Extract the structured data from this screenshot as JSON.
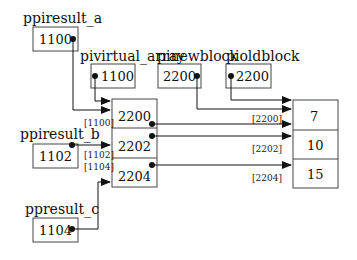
{
  "pointers": [
    {
      "name": "ppiresult_a",
      "value": "1100"
    },
    {
      "name": "pivirtual_array",
      "value": "1100"
    },
    {
      "name": "pinewblock",
      "value": "2200"
    },
    {
      "name": "pioldblock",
      "value": "2200"
    },
    {
      "name": "ppiresult_b",
      "value": "1102"
    },
    {
      "name": "ppresult_c",
      "value": "1104"
    }
  ],
  "virtual_array": {
    "cells": [
      "2200",
      "2202",
      "2204"
    ],
    "addresses": [
      "[1100]",
      "[1102]",
      "[1104]"
    ]
  },
  "data_block": {
    "cells": [
      "7",
      "10",
      "15"
    ],
    "addresses": [
      "[2200]",
      "[2202]",
      "[2204]"
    ]
  },
  "colors": {
    "line": "#333333",
    "background": "#ffffff"
  }
}
